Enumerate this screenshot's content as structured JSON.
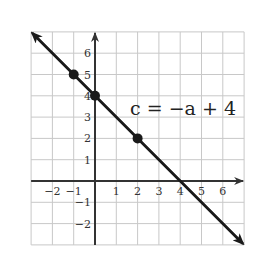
{
  "chart_data": {
    "type": "line",
    "title": "",
    "equation_label": "c = −a + 4",
    "xlabel": "a",
    "ylabel": "c",
    "xlim": [
      -3,
      7
    ],
    "ylim": [
      -3,
      7
    ],
    "grid": true,
    "x_ticks": [
      -2,
      -1,
      1,
      2,
      3,
      4,
      5,
      6
    ],
    "y_ticks": [
      -2,
      -1,
      1,
      2,
      3,
      4,
      5,
      6
    ],
    "x_tick_labels": [
      "−2",
      "−1",
      "1",
      "2",
      "3",
      "4",
      "5",
      "6"
    ],
    "y_tick_labels": [
      "−2",
      "−1",
      "1",
      "2",
      "3",
      "4",
      "5",
      "6"
    ],
    "series": [
      {
        "name": "c = −a + 4",
        "slope": -1,
        "intercept": 4,
        "line_from": [
          -3,
          7
        ],
        "line_to": [
          7,
          -3
        ],
        "arrows": true,
        "points": [
          {
            "x": -1,
            "y": 5
          },
          {
            "x": 0,
            "y": 4
          },
          {
            "x": 2,
            "y": 2
          }
        ]
      }
    ],
    "colors": {
      "line": "#1a1a1a",
      "grid": "#c8c8c8",
      "axis": "#333333"
    }
  }
}
